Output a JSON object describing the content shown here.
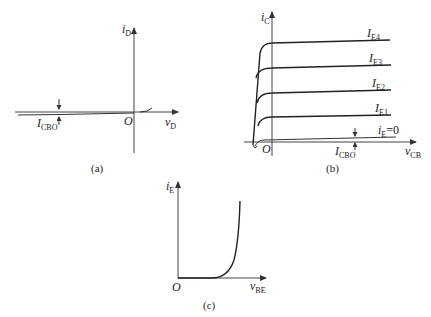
{
  "panels": {
    "a": {
      "caption": "(a)",
      "y_axis": {
        "var": "i",
        "sub": "D"
      },
      "x_axis": {
        "var": "v",
        "sub": "D"
      },
      "origin": "O",
      "annotation": {
        "var": "I",
        "sub": "CBO"
      }
    },
    "b": {
      "caption": "(b)",
      "y_axis": {
        "var": "i",
        "sub": "C"
      },
      "x_axis": {
        "var": "v",
        "sub": "CB"
      },
      "origin": "O",
      "curves": [
        {
          "var": "I",
          "sub": "E4"
        },
        {
          "var": "I",
          "sub": "E3"
        },
        {
          "var": "I",
          "sub": "E2"
        },
        {
          "var": "I",
          "sub": "E1"
        },
        {
          "var": "i",
          "sub": "E",
          "suffix": "=0"
        }
      ],
      "annotation": {
        "var": "I",
        "sub": "CBO"
      }
    },
    "c": {
      "caption": "(c)",
      "y_axis": {
        "var": "i",
        "sub": "E"
      },
      "x_axis": {
        "var": "v",
        "sub": "BE"
      },
      "origin": "O"
    }
  },
  "colors": {
    "line": "#222222",
    "axis": "#444444",
    "background": "#ffffff"
  }
}
